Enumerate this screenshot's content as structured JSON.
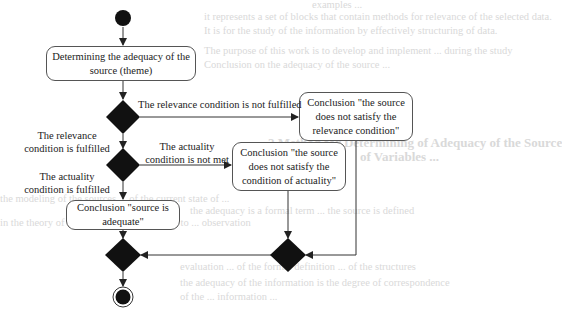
{
  "background_text": [
    "examples ...",
    "it represents a set of blocks that contain methods for relevance of the selected data.",
    "It is for the study of the information by effectively structuring of data.",
    "The purpose of this work is to develop and implement ... during the study",
    "Conclusion on the adequacy of the source ...",
    "2 Method for Determining of Adequacy of the Source",
    "of Variables ...",
    "the modeling of the sources ... of the current state of ...",
    "the adequacy is a formal term ... the source is defined",
    "in the theory of information ... with regard to ... observation",
    "evaluation ... of the formal definition ... of the structures",
    "the adequacy of the information is the degree of correspondence",
    "of the ... information ..."
  ],
  "diagram": {
    "start_node": "initial-node",
    "end_node": "final-node",
    "boxes": {
      "determine": "Determining the adequacy of the source (theme)",
      "not_relevant": "Conclusion \"the source does not satisfy the relevance condition\"",
      "not_actual": "Conclusion \"the source does not satisfy the condition of actuality\"",
      "adequate": "Conclusion \"source is adequate\""
    },
    "labels": {
      "relevance_not_fulfilled": "The relevance condition is not fulfilled",
      "relevance_fulfilled_1": "The relevance",
      "relevance_fulfilled_2": "condition is fulfilled",
      "actuality_not_met_1": "The actuality",
      "actuality_not_met_2": "condition is not met",
      "actuality_fulfilled_1": "The actuality",
      "actuality_fulfilled_2": "condition is fulfilled"
    }
  }
}
